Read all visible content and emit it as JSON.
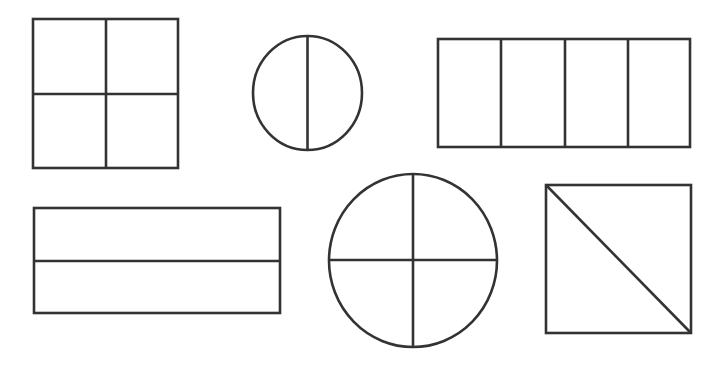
{
  "diagram": {
    "stroke_color": "#333333",
    "background": "#ffffff",
    "stroke_width": 2.6,
    "shapes": [
      {
        "id": "square-quarters",
        "type": "rect",
        "x": 33,
        "y": 19,
        "w": 145,
        "h": 149,
        "parts": 4,
        "divisions": [
          {
            "x1": 106,
            "y1": 19,
            "x2": 106,
            "y2": 168
          },
          {
            "x1": 33,
            "y1": 94,
            "x2": 178,
            "y2": 94
          }
        ]
      },
      {
        "id": "circle-halves",
        "type": "ellipse",
        "cx": 307.5,
        "cy": 93,
        "rx": 54.5,
        "ry": 57,
        "parts": 2,
        "divisions": [
          {
            "x1": 307.5,
            "y1": 36,
            "x2": 307.5,
            "y2": 150
          }
        ]
      },
      {
        "id": "rectangle-fourths",
        "type": "rect",
        "x": 438,
        "y": 39,
        "w": 252,
        "h": 108,
        "parts": 4,
        "divisions": [
          {
            "x1": 501,
            "y1": 39,
            "x2": 501,
            "y2": 147
          },
          {
            "x1": 565,
            "y1": 39,
            "x2": 565,
            "y2": 147
          },
          {
            "x1": 628,
            "y1": 39,
            "x2": 628,
            "y2": 147
          }
        ]
      },
      {
        "id": "rectangle-halves",
        "type": "rect",
        "x": 34,
        "y": 208,
        "w": 246,
        "h": 105,
        "parts": 2,
        "divisions": [
          {
            "x1": 34,
            "y1": 261,
            "x2": 280,
            "y2": 261
          }
        ]
      },
      {
        "id": "circle-quarters",
        "type": "ellipse",
        "cx": 413,
        "cy": 260.5,
        "rx": 84,
        "ry": 86.5,
        "parts": 4,
        "divisions": [
          {
            "x1": 413,
            "y1": 174,
            "x2": 413,
            "y2": 347
          },
          {
            "x1": 329,
            "y1": 260,
            "x2": 497,
            "y2": 260
          }
        ]
      },
      {
        "id": "square-diagonal-halves",
        "type": "rect",
        "x": 546,
        "y": 185,
        "w": 145,
        "h": 148,
        "parts": 2,
        "divisions": [
          {
            "x1": 546,
            "y1": 185,
            "x2": 691,
            "y2": 333
          }
        ]
      }
    ]
  }
}
